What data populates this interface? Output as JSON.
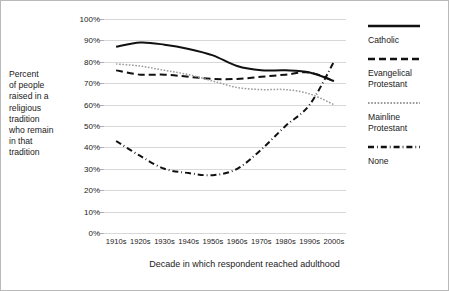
{
  "chart_data": {
    "type": "line",
    "title": "",
    "xlabel": "Decade in which respondent reached adulthood",
    "ylabel": "Percent\nof people\nraised in a\nreligious\ntradition\nwho remain\nin that\ntradition",
    "categories": [
      "1910s",
      "1920s",
      "1930s",
      "1940s",
      "1950s",
      "1960s",
      "1970s",
      "1980s",
      "1990s",
      "2000s"
    ],
    "ylim": [
      0,
      100
    ],
    "ytick_labels": [
      "0%",
      "10%",
      "20%",
      "30%",
      "40%",
      "50%",
      "60%",
      "70%",
      "80%",
      "90%",
      "100%"
    ],
    "ytick_values": [
      0,
      10,
      20,
      30,
      40,
      50,
      60,
      70,
      80,
      90,
      100
    ],
    "grid": true,
    "legend_position": "right",
    "series": [
      {
        "name": "Catholic",
        "style": "solid",
        "color": "#111111",
        "values": [
          87,
          89,
          88,
          86,
          83,
          78,
          76,
          76,
          75,
          71
        ]
      },
      {
        "name": "Evangelical\nProtestant",
        "style": "dashed",
        "color": "#111111",
        "values": [
          76,
          74,
          74,
          73,
          72,
          72,
          73,
          74,
          75,
          71
        ]
      },
      {
        "name": "Mainline\nProtestant",
        "style": "dotted",
        "color": "#9a9a9a",
        "values": [
          79,
          78,
          76,
          74,
          71,
          68,
          67,
          67,
          65,
          60
        ]
      },
      {
        "name": "None",
        "style": "dashdot",
        "color": "#111111",
        "values": [
          43,
          36,
          30,
          28,
          27,
          30,
          39,
          50,
          60,
          80
        ]
      }
    ]
  },
  "legend": {
    "entries": [
      {
        "label": "Catholic",
        "style": "solid"
      },
      {
        "label": "Evangelical\nProtestant",
        "style": "dashed"
      },
      {
        "label": "Mainline\nProtestant",
        "style": "dotted"
      },
      {
        "label": "None",
        "style": "dashdot"
      }
    ]
  }
}
